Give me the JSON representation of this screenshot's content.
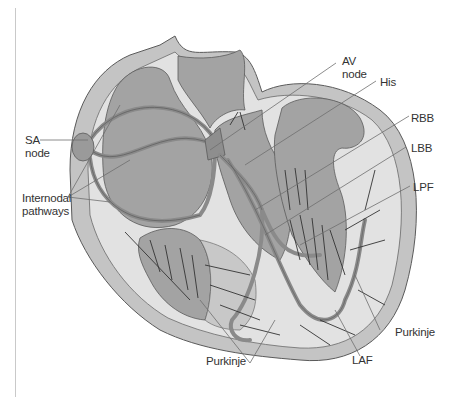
{
  "diagram": {
    "labels": {
      "sa_node": [
        "SA",
        "node"
      ],
      "internodal": [
        "Internodal",
        "pathways"
      ],
      "av_node": [
        "AV",
        "node"
      ],
      "his": "His",
      "rbb": "RBB",
      "lbb": "LBB",
      "lpf": "LPF",
      "purkinje_left": "Purkinje",
      "purkinje_right": "Purkinje",
      "laf": "LAF"
    },
    "colors": {
      "outer_wall": "#c4c4c4",
      "inner_wall": "#e2e2e2",
      "chamber": "#a3a3a3",
      "pathway": "#8a8a8a",
      "outline": "#5a5a5a",
      "leader_line": "#6e6e6e",
      "text": "#333333"
    }
  }
}
